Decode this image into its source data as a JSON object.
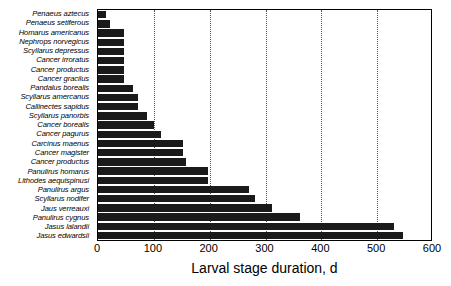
{
  "chart_data": {
    "type": "bar",
    "orientation": "horizontal",
    "title": "",
    "xlabel": "Larval stage duration, d",
    "ylabel": "",
    "xlim": [
      0,
      600
    ],
    "ylim": null,
    "grid": "vertical-dotted",
    "legend": null,
    "xticks": [
      0,
      100,
      200,
      300,
      400,
      500,
      600
    ],
    "bar_color": "#1a1a1a",
    "categories": [
      "Penaeus aztecus",
      "Penaeus setiferous",
      "Homarus americanus",
      "Nephrops norvegicus",
      "Scyllarus depressus",
      "Cancer irroratus",
      "Cancer productus",
      "Cancer gracilus",
      "Pandalus borealis",
      "Scyllarus amercanus",
      "Callinectes sapidus",
      "Scyllarus panorbis",
      "Cancer borealis",
      "Cancer pagurus",
      "Carcinus maenus",
      "Cancer magister",
      "Cancer productus",
      "Panulirus homarus",
      "Lithodes aequispinusi",
      "Panulirus argus",
      "Scyllarus nodifer",
      "Jaus verreauxi",
      "Panulirus cygnus",
      "Jasus lalandii",
      "Jasus edwardsii"
    ],
    "values": [
      14,
      22,
      47,
      47,
      47,
      47,
      47,
      47,
      62,
      72,
      72,
      88,
      101,
      112,
      152,
      152,
      157,
      197,
      197,
      270,
      282,
      312,
      362,
      530,
      547
    ]
  }
}
